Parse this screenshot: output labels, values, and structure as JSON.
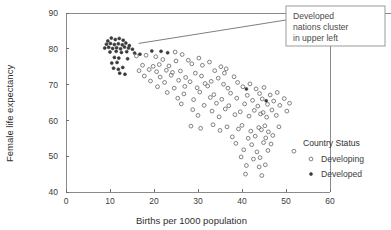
{
  "chart_data": {
    "type": "scatter",
    "title": "",
    "xlabel": "Births per 1000 population",
    "ylabel": "Female life expectancy",
    "xlim": [
      0,
      60
    ],
    "ylim": [
      40,
      90
    ],
    "xticks": [
      "0",
      "10",
      "20",
      "30",
      "40",
      "50",
      "60"
    ],
    "yticks": [
      "40",
      "50",
      "60",
      "70",
      "80",
      "90"
    ],
    "grid": false,
    "legend": {
      "title": "Country Status",
      "position": "right",
      "entries": [
        {
          "label": "Developing",
          "marker": "open-circle",
          "color": "#6c6c6c"
        },
        {
          "label": "Developed",
          "marker": "filled-circle",
          "color": "#3a3a3a"
        }
      ]
    },
    "annotation": {
      "text": "Developed nations cluster in upper left",
      "lines": [
        "Developed",
        "nations cluster",
        "in upper left"
      ],
      "target_x": 16.5,
      "target_y": 81.5
    },
    "series": [
      {
        "name": "Developed",
        "marker": "filled-circle",
        "points": [
          [
            9.5,
            82.2
          ],
          [
            10.3,
            83.0
          ],
          [
            11.2,
            82.6
          ],
          [
            12.1,
            82.9
          ],
          [
            13.0,
            82.4
          ],
          [
            9.2,
            81.3
          ],
          [
            10.1,
            81.5
          ],
          [
            11.0,
            81.2
          ],
          [
            11.9,
            81.4
          ],
          [
            12.8,
            81.1
          ],
          [
            13.6,
            81.6
          ],
          [
            14.4,
            80.9
          ],
          [
            8.8,
            80.2
          ],
          [
            9.7,
            80.4
          ],
          [
            10.6,
            80.1
          ],
          [
            11.5,
            80.3
          ],
          [
            12.4,
            80.0
          ],
          [
            13.3,
            80.5
          ],
          [
            14.2,
            80.2
          ],
          [
            15.1,
            79.9
          ],
          [
            10.0,
            79.1
          ],
          [
            11.4,
            79.3
          ],
          [
            12.6,
            79.0
          ],
          [
            13.8,
            79.2
          ],
          [
            15.6,
            78.8
          ],
          [
            16.8,
            78.5
          ],
          [
            11.0,
            77.6
          ],
          [
            12.0,
            77.4
          ],
          [
            14.0,
            77.2
          ],
          [
            10.4,
            76.0
          ],
          [
            11.6,
            76.2
          ],
          [
            10.8,
            74.6
          ],
          [
            11.9,
            74.3
          ],
          [
            12.9,
            74.8
          ],
          [
            12.2,
            73.2
          ],
          [
            13.4,
            72.9
          ],
          [
            19.5,
            79.4
          ],
          [
            21.6,
            79.3
          ],
          [
            23.1,
            78.9
          ],
          [
            41.0,
            68.8
          ],
          [
            45.5,
            65.5
          ]
        ]
      },
      {
        "name": "Developing",
        "marker": "open-circle",
        "points": [
          [
            16.0,
            78.0
          ],
          [
            18.2,
            78.2
          ],
          [
            20.4,
            77.8
          ],
          [
            24.8,
            79.1
          ],
          [
            26.4,
            78.4
          ],
          [
            22.0,
            77.0
          ],
          [
            25.0,
            76.6
          ],
          [
            27.8,
            76.8
          ],
          [
            30.2,
            77.4
          ],
          [
            32.6,
            76.3
          ],
          [
            17.4,
            75.4
          ],
          [
            19.8,
            75.1
          ],
          [
            21.2,
            75.6
          ],
          [
            23.4,
            75.2
          ],
          [
            28.6,
            75.8
          ],
          [
            31.0,
            75.4
          ],
          [
            35.2,
            75.0
          ],
          [
            36.4,
            74.4
          ],
          [
            16.6,
            73.9
          ],
          [
            18.9,
            74.2
          ],
          [
            20.6,
            73.6
          ],
          [
            22.8,
            74.0
          ],
          [
            24.2,
            73.4
          ],
          [
            26.0,
            73.8
          ],
          [
            29.4,
            73.2
          ],
          [
            33.8,
            73.9
          ],
          [
            36.0,
            73.2
          ],
          [
            17.8,
            72.4
          ],
          [
            21.4,
            72.1
          ],
          [
            23.9,
            72.6
          ],
          [
            27.2,
            72.0
          ],
          [
            30.8,
            72.4
          ],
          [
            34.6,
            71.8
          ],
          [
            38.2,
            72.2
          ],
          [
            19.2,
            71.0
          ],
          [
            22.4,
            70.6
          ],
          [
            25.6,
            71.2
          ],
          [
            28.2,
            70.8
          ],
          [
            31.6,
            70.3
          ],
          [
            33.0,
            70.9
          ],
          [
            35.8,
            70.1
          ],
          [
            39.0,
            70.6
          ],
          [
            41.8,
            70.2
          ],
          [
            20.8,
            69.4
          ],
          [
            24.6,
            69.0
          ],
          [
            27.0,
            69.5
          ],
          [
            29.8,
            69.1
          ],
          [
            32.2,
            69.6
          ],
          [
            36.8,
            69.0
          ],
          [
            40.2,
            69.4
          ],
          [
            43.2,
            68.8
          ],
          [
            45.0,
            69.2
          ],
          [
            23.0,
            67.8
          ],
          [
            26.8,
            67.4
          ],
          [
            30.4,
            67.9
          ],
          [
            33.6,
            67.2
          ],
          [
            37.4,
            67.6
          ],
          [
            41.2,
            67.0
          ],
          [
            44.0,
            67.5
          ],
          [
            46.4,
            67.1
          ],
          [
            48.0,
            67.8
          ],
          [
            25.4,
            66.2
          ],
          [
            29.0,
            65.8
          ],
          [
            32.8,
            66.4
          ],
          [
            35.4,
            65.9
          ],
          [
            38.8,
            66.2
          ],
          [
            42.4,
            65.6
          ],
          [
            44.6,
            66.0
          ],
          [
            47.2,
            65.4
          ],
          [
            49.6,
            66.1
          ],
          [
            26.2,
            64.6
          ],
          [
            31.4,
            64.2
          ],
          [
            34.2,
            64.8
          ],
          [
            37.0,
            64.1
          ],
          [
            40.6,
            64.6
          ],
          [
            43.6,
            64.0
          ],
          [
            45.8,
            64.5
          ],
          [
            48.6,
            64.2
          ],
          [
            50.8,
            64.8
          ],
          [
            28.8,
            63.0
          ],
          [
            33.2,
            62.6
          ],
          [
            36.2,
            63.2
          ],
          [
            39.6,
            62.4
          ],
          [
            42.8,
            62.8
          ],
          [
            44.8,
            62.2
          ],
          [
            46.8,
            62.9
          ],
          [
            50.2,
            62.6
          ],
          [
            30.0,
            61.4
          ],
          [
            34.8,
            61.0
          ],
          [
            38.4,
            61.6
          ],
          [
            41.6,
            61.2
          ],
          [
            44.2,
            61.8
          ],
          [
            45.6,
            60.9
          ],
          [
            47.8,
            61.4
          ],
          [
            28.4,
            58.4
          ],
          [
            33.4,
            58.8
          ],
          [
            36.6,
            58.2
          ],
          [
            40.0,
            58.6
          ],
          [
            43.8,
            58.0
          ],
          [
            45.2,
            58.5
          ],
          [
            48.4,
            58.2
          ],
          [
            30.6,
            57.8
          ],
          [
            35.0,
            57.2
          ],
          [
            39.2,
            57.6
          ],
          [
            42.0,
            57.0
          ],
          [
            44.4,
            57.4
          ],
          [
            46.0,
            56.8
          ],
          [
            37.8,
            55.4
          ],
          [
            41.4,
            55.0
          ],
          [
            43.0,
            55.6
          ],
          [
            45.4,
            55.1
          ],
          [
            47.0,
            55.8
          ],
          [
            38.6,
            53.6
          ],
          [
            42.2,
            53.2
          ],
          [
            44.9,
            53.8
          ],
          [
            46.6,
            53.4
          ],
          [
            40.4,
            51.8
          ],
          [
            43.4,
            51.2
          ],
          [
            45.9,
            51.6
          ],
          [
            51.8,
            51.4
          ],
          [
            39.8,
            49.8
          ],
          [
            42.6,
            49.2
          ],
          [
            44.1,
            49.6
          ],
          [
            41.0,
            47.4
          ],
          [
            43.9,
            47.0
          ],
          [
            45.3,
            47.6
          ],
          [
            40.8,
            45.0
          ],
          [
            44.5,
            44.6
          ]
        ]
      }
    ]
  }
}
